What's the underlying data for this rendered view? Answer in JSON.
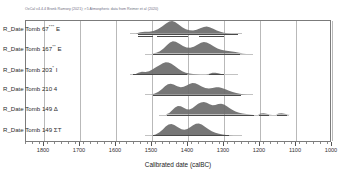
{
  "header": {
    "citation": "OxCal v4.4.4 Bronk Ramsey (2021); r:5 Atmospheric data from Reimer et al (2020)"
  },
  "axis": {
    "title": "Calibrated date (calBC)",
    "ticks": [
      1800,
      1700,
      1600,
      1500,
      1400,
      1300,
      1200,
      1100,
      1000
    ],
    "tick_labels": [
      "1800",
      "1700",
      "1600",
      "1500",
      "1400",
      "1300",
      "1200",
      "1100",
      "1000"
    ],
    "min": 1000,
    "max": 1850,
    "direction": "descending",
    "minor_tick_step": 20
  },
  "rows": [
    {
      "label": "R_Date Tomb 67*** E",
      "name": "Tomb 67*** E"
    },
    {
      "label": "R_Date Tomb 167** E",
      "name": "Tomb 167** E"
    },
    {
      "label": "R_Date Tomb 203* I",
      "name": "Tomb 203* I"
    },
    {
      "label": "R_Date Tomb 210 4",
      "name": "Tomb 210 4"
    },
    {
      "label": "R_Date Tomb 149 Δ",
      "name": "Tomb 149 Δ"
    },
    {
      "label": "R_Date Tomb 149 ΣT",
      "name": "Tomb 149 ΣT"
    }
  ],
  "colors": {
    "distribution_fill": "#6b6b6b",
    "range_bar": "#4a4a4a",
    "grid": "#b9b9b9",
    "frame": "#7b7b7b",
    "citation": "#6f6f82"
  },
  "chart_data": {
    "type": "area",
    "title": "",
    "xlabel": "Calibrated date (calBC)",
    "ylabel": "",
    "xlim": [
      1850,
      1000
    ],
    "grid": true,
    "legend": "none",
    "note": "OxCal multi-plot of calibrated radiocarbon probability distributions; each row shows a posterior density curve with 68.3%/95.4% highest-posterior-density range bars beneath.",
    "series": [
      {
        "name": "R_Date Tomb 67*** E",
        "baseline_from": 1560,
        "baseline_to": 1250,
        "density": [
          {
            "x": 1545,
            "y": 0.0
          },
          {
            "x": 1532,
            "y": 0.1
          },
          {
            "x": 1520,
            "y": 0.14
          },
          {
            "x": 1508,
            "y": 0.13
          },
          {
            "x": 1496,
            "y": 0.2
          },
          {
            "x": 1484,
            "y": 0.34
          },
          {
            "x": 1472,
            "y": 0.55
          },
          {
            "x": 1462,
            "y": 0.78
          },
          {
            "x": 1452,
            "y": 0.95
          },
          {
            "x": 1444,
            "y": 1.0
          },
          {
            "x": 1436,
            "y": 0.92
          },
          {
            "x": 1426,
            "y": 0.72
          },
          {
            "x": 1416,
            "y": 0.5
          },
          {
            "x": 1406,
            "y": 0.34
          },
          {
            "x": 1396,
            "y": 0.26
          },
          {
            "x": 1386,
            "y": 0.24
          },
          {
            "x": 1376,
            "y": 0.3
          },
          {
            "x": 1366,
            "y": 0.42
          },
          {
            "x": 1356,
            "y": 0.52
          },
          {
            "x": 1348,
            "y": 0.55
          },
          {
            "x": 1340,
            "y": 0.5
          },
          {
            "x": 1330,
            "y": 0.38
          },
          {
            "x": 1320,
            "y": 0.24
          },
          {
            "x": 1310,
            "y": 0.13
          },
          {
            "x": 1300,
            "y": 0.06
          },
          {
            "x": 1290,
            "y": 0.02
          },
          {
            "x": 1280,
            "y": 0.0
          }
        ],
        "ranges": [
          {
            "level": "95.4%",
            "from": 1540,
            "to": 1262,
            "row": 0
          },
          {
            "level": "68.3%",
            "from": 1540,
            "to": 1496,
            "row": 1
          },
          {
            "level": "68.3%",
            "from": 1486,
            "to": 1400,
            "row": 1
          },
          {
            "level": "68.3%",
            "from": 1370,
            "to": 1300,
            "row": 1
          }
        ]
      },
      {
        "name": "R_Date Tomb 167** E",
        "baseline_from": 1520,
        "baseline_to": 1220,
        "density": [
          {
            "x": 1500,
            "y": 0.0
          },
          {
            "x": 1488,
            "y": 0.06
          },
          {
            "x": 1478,
            "y": 0.18
          },
          {
            "x": 1468,
            "y": 0.4
          },
          {
            "x": 1458,
            "y": 0.68
          },
          {
            "x": 1450,
            "y": 0.88
          },
          {
            "x": 1442,
            "y": 0.97
          },
          {
            "x": 1434,
            "y": 0.94
          },
          {
            "x": 1424,
            "y": 0.78
          },
          {
            "x": 1414,
            "y": 0.6
          },
          {
            "x": 1404,
            "y": 0.48
          },
          {
            "x": 1394,
            "y": 0.46
          },
          {
            "x": 1384,
            "y": 0.54
          },
          {
            "x": 1374,
            "y": 0.7
          },
          {
            "x": 1364,
            "y": 0.86
          },
          {
            "x": 1356,
            "y": 0.92
          },
          {
            "x": 1348,
            "y": 0.88
          },
          {
            "x": 1338,
            "y": 0.74
          },
          {
            "x": 1328,
            "y": 0.56
          },
          {
            "x": 1318,
            "y": 0.4
          },
          {
            "x": 1308,
            "y": 0.3
          },
          {
            "x": 1298,
            "y": 0.24
          },
          {
            "x": 1288,
            "y": 0.2
          },
          {
            "x": 1278,
            "y": 0.16
          },
          {
            "x": 1268,
            "y": 0.11
          },
          {
            "x": 1258,
            "y": 0.06
          },
          {
            "x": 1248,
            "y": 0.02
          },
          {
            "x": 1238,
            "y": 0.0
          }
        ],
        "ranges": [
          {
            "level": "95.4%",
            "from": 1496,
            "to": 1256,
            "row": 0
          }
        ]
      },
      {
        "name": "R_Date Tomb 203* I",
        "baseline_from": 1560,
        "baseline_to": 1260,
        "density": [
          {
            "x": 1548,
            "y": 0.0
          },
          {
            "x": 1538,
            "y": 0.14
          },
          {
            "x": 1528,
            "y": 0.22
          },
          {
            "x": 1518,
            "y": 0.2
          },
          {
            "x": 1508,
            "y": 0.26
          },
          {
            "x": 1498,
            "y": 0.42
          },
          {
            "x": 1488,
            "y": 0.6
          },
          {
            "x": 1478,
            "y": 0.76
          },
          {
            "x": 1470,
            "y": 0.9
          },
          {
            "x": 1462,
            "y": 0.98
          },
          {
            "x": 1454,
            "y": 0.96
          },
          {
            "x": 1446,
            "y": 0.86
          },
          {
            "x": 1436,
            "y": 0.66
          },
          {
            "x": 1426,
            "y": 0.44
          },
          {
            "x": 1416,
            "y": 0.26
          },
          {
            "x": 1406,
            "y": 0.14
          },
          {
            "x": 1396,
            "y": 0.07
          },
          {
            "x": 1386,
            "y": 0.03
          },
          {
            "x": 1376,
            "y": 0.01
          },
          {
            "x": 1366,
            "y": 0.0
          },
          {
            "x": 1350,
            "y": 0.0
          },
          {
            "x": 1340,
            "y": 0.06
          },
          {
            "x": 1332,
            "y": 0.13
          },
          {
            "x": 1324,
            "y": 0.14
          },
          {
            "x": 1316,
            "y": 0.1
          },
          {
            "x": 1308,
            "y": 0.04
          },
          {
            "x": 1300,
            "y": 0.0
          }
        ],
        "ranges": [
          {
            "level": "95.4%",
            "from": 1552,
            "to": 1404,
            "row": 0
          },
          {
            "level": "95.4%",
            "from": 1342,
            "to": 1300,
            "row": 0
          }
        ]
      },
      {
        "name": "R_Date Tomb 210 4",
        "baseline_from": 1520,
        "baseline_to": 1220,
        "density": [
          {
            "x": 1502,
            "y": 0.0
          },
          {
            "x": 1492,
            "y": 0.08
          },
          {
            "x": 1482,
            "y": 0.22
          },
          {
            "x": 1472,
            "y": 0.44
          },
          {
            "x": 1464,
            "y": 0.66
          },
          {
            "x": 1456,
            "y": 0.82
          },
          {
            "x": 1448,
            "y": 0.86
          },
          {
            "x": 1440,
            "y": 0.8
          },
          {
            "x": 1430,
            "y": 0.66
          },
          {
            "x": 1420,
            "y": 0.58
          },
          {
            "x": 1412,
            "y": 0.62
          },
          {
            "x": 1404,
            "y": 0.72
          },
          {
            "x": 1396,
            "y": 0.84
          },
          {
            "x": 1388,
            "y": 0.92
          },
          {
            "x": 1380,
            "y": 0.9
          },
          {
            "x": 1372,
            "y": 0.8
          },
          {
            "x": 1362,
            "y": 0.64
          },
          {
            "x": 1352,
            "y": 0.52
          },
          {
            "x": 1342,
            "y": 0.48
          },
          {
            "x": 1332,
            "y": 0.52
          },
          {
            "x": 1322,
            "y": 0.58
          },
          {
            "x": 1314,
            "y": 0.58
          },
          {
            "x": 1306,
            "y": 0.52
          },
          {
            "x": 1296,
            "y": 0.42
          },
          {
            "x": 1286,
            "y": 0.3
          },
          {
            "x": 1276,
            "y": 0.2
          },
          {
            "x": 1266,
            "y": 0.12
          },
          {
            "x": 1256,
            "y": 0.06
          },
          {
            "x": 1246,
            "y": 0.02
          },
          {
            "x": 1236,
            "y": 0.0
          }
        ],
        "ranges": [
          {
            "level": "95.4%",
            "from": 1498,
            "to": 1252,
            "row": 0
          }
        ]
      },
      {
        "name": "R_Date Tomb 149 Δ",
        "baseline_from": 1480,
        "baseline_to": 1120,
        "density": [
          {
            "x": 1462,
            "y": 0.0
          },
          {
            "x": 1452,
            "y": 0.12
          },
          {
            "x": 1444,
            "y": 0.34
          },
          {
            "x": 1436,
            "y": 0.56
          },
          {
            "x": 1428,
            "y": 0.68
          },
          {
            "x": 1420,
            "y": 0.66
          },
          {
            "x": 1412,
            "y": 0.54
          },
          {
            "x": 1404,
            "y": 0.42
          },
          {
            "x": 1396,
            "y": 0.4
          },
          {
            "x": 1388,
            "y": 0.5
          },
          {
            "x": 1380,
            "y": 0.68
          },
          {
            "x": 1372,
            "y": 0.86
          },
          {
            "x": 1364,
            "y": 0.96
          },
          {
            "x": 1356,
            "y": 1.0
          },
          {
            "x": 1348,
            "y": 0.94
          },
          {
            "x": 1340,
            "y": 0.82
          },
          {
            "x": 1332,
            "y": 0.74
          },
          {
            "x": 1324,
            "y": 0.76
          },
          {
            "x": 1316,
            "y": 0.84
          },
          {
            "x": 1308,
            "y": 0.86
          },
          {
            "x": 1300,
            "y": 0.8
          },
          {
            "x": 1292,
            "y": 0.66
          },
          {
            "x": 1284,
            "y": 0.5
          },
          {
            "x": 1276,
            "y": 0.36
          },
          {
            "x": 1268,
            "y": 0.24
          },
          {
            "x": 1258,
            "y": 0.14
          },
          {
            "x": 1248,
            "y": 0.08
          },
          {
            "x": 1238,
            "y": 0.04
          },
          {
            "x": 1228,
            "y": 0.02
          },
          {
            "x": 1218,
            "y": 0.0
          },
          {
            "x": 1206,
            "y": 0.0
          },
          {
            "x": 1198,
            "y": 0.08
          },
          {
            "x": 1190,
            "y": 0.1
          },
          {
            "x": 1182,
            "y": 0.06
          },
          {
            "x": 1174,
            "y": 0.01
          },
          {
            "x": 1166,
            "y": 0.0
          },
          {
            "x": 1156,
            "y": 0.0
          },
          {
            "x": 1148,
            "y": 0.07
          },
          {
            "x": 1140,
            "y": 0.09
          },
          {
            "x": 1132,
            "y": 0.05
          },
          {
            "x": 1124,
            "y": 0.01
          },
          {
            "x": 1116,
            "y": 0.0
          }
        ],
        "ranges": [
          {
            "level": "95.4%",
            "from": 1458,
            "to": 1218,
            "row": 0
          },
          {
            "level": "95.4%",
            "from": 1202,
            "to": 1174,
            "row": 0
          },
          {
            "level": "95.4%",
            "from": 1152,
            "to": 1124,
            "row": 0
          }
        ]
      },
      {
        "name": "R_Date Tomb 149 ΣT",
        "baseline_from": 1520,
        "baseline_to": 1250,
        "density": [
          {
            "x": 1500,
            "y": 0.0
          },
          {
            "x": 1490,
            "y": 0.08
          },
          {
            "x": 1480,
            "y": 0.24
          },
          {
            "x": 1470,
            "y": 0.48
          },
          {
            "x": 1462,
            "y": 0.72
          },
          {
            "x": 1454,
            "y": 0.88
          },
          {
            "x": 1446,
            "y": 0.92
          },
          {
            "x": 1438,
            "y": 0.84
          },
          {
            "x": 1428,
            "y": 0.66
          },
          {
            "x": 1418,
            "y": 0.5
          },
          {
            "x": 1410,
            "y": 0.46
          },
          {
            "x": 1402,
            "y": 0.52
          },
          {
            "x": 1394,
            "y": 0.66
          },
          {
            "x": 1386,
            "y": 0.82
          },
          {
            "x": 1378,
            "y": 0.94
          },
          {
            "x": 1370,
            "y": 0.96
          },
          {
            "x": 1362,
            "y": 0.88
          },
          {
            "x": 1354,
            "y": 0.72
          },
          {
            "x": 1344,
            "y": 0.52
          },
          {
            "x": 1334,
            "y": 0.34
          },
          {
            "x": 1324,
            "y": 0.22
          },
          {
            "x": 1314,
            "y": 0.14
          },
          {
            "x": 1304,
            "y": 0.08
          },
          {
            "x": 1294,
            "y": 0.04
          },
          {
            "x": 1284,
            "y": 0.02
          },
          {
            "x": 1274,
            "y": 0.0
          }
        ],
        "ranges": [
          {
            "level": "95.4%",
            "from": 1496,
            "to": 1286,
            "row": 0
          }
        ]
      }
    ]
  }
}
